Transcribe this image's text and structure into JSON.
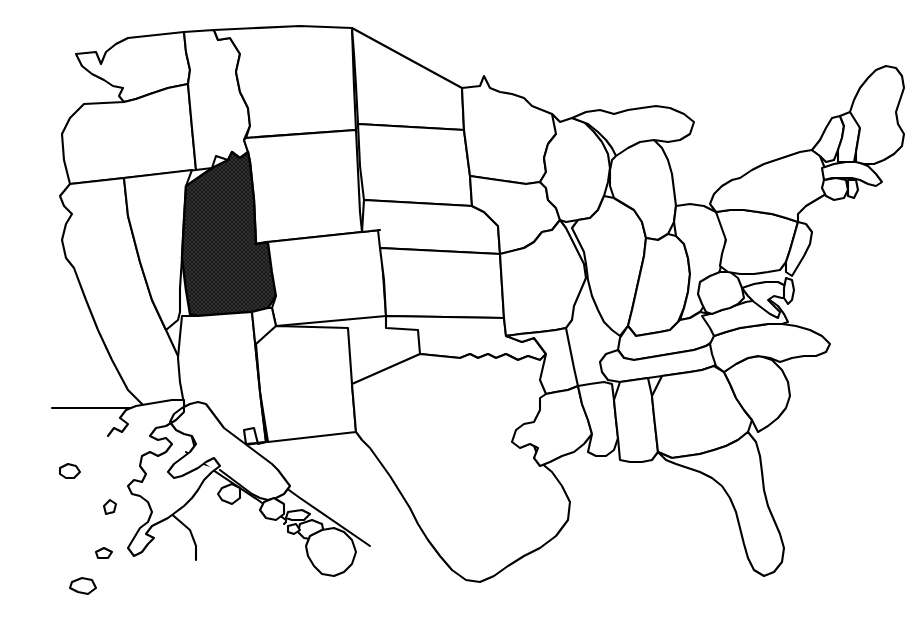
{
  "figure": {
    "title": "Map of the United States with Utah highlighted",
    "caption": "",
    "width": 921,
    "height": 638
  },
  "style": {
    "background_color": "#ffffff",
    "outline_color": "#000000",
    "state_fill_color": "#ffffff",
    "highlight_fill_color": "#1a1a1a",
    "highlight_pattern": "crosshatch"
  },
  "map": {
    "projection_note": "contiguous United States with Alaska and Hawaii insets at lower left",
    "highlighted_state": "Utah",
    "highlighted_state_abbr": "UT",
    "insets": [
      {
        "name": "Alaska",
        "abbr": "AK",
        "highlighted": false
      },
      {
        "name": "Hawaii",
        "abbr": "HI",
        "highlighted": false
      }
    ],
    "states": [
      {
        "abbr": "WA",
        "name": "Washington",
        "highlighted": false
      },
      {
        "abbr": "OR",
        "name": "Oregon",
        "highlighted": false
      },
      {
        "abbr": "CA",
        "name": "California",
        "highlighted": false
      },
      {
        "abbr": "NV",
        "name": "Nevada",
        "highlighted": false
      },
      {
        "abbr": "ID",
        "name": "Idaho",
        "highlighted": false
      },
      {
        "abbr": "MT",
        "name": "Montana",
        "highlighted": false
      },
      {
        "abbr": "WY",
        "name": "Wyoming",
        "highlighted": false
      },
      {
        "abbr": "UT",
        "name": "Utah",
        "highlighted": true
      },
      {
        "abbr": "AZ",
        "name": "Arizona",
        "highlighted": false
      },
      {
        "abbr": "CO",
        "name": "Colorado",
        "highlighted": false
      },
      {
        "abbr": "NM",
        "name": "New Mexico",
        "highlighted": false
      },
      {
        "abbr": "ND",
        "name": "North Dakota",
        "highlighted": false
      },
      {
        "abbr": "SD",
        "name": "South Dakota",
        "highlighted": false
      },
      {
        "abbr": "NE",
        "name": "Nebraska",
        "highlighted": false
      },
      {
        "abbr": "KS",
        "name": "Kansas",
        "highlighted": false
      },
      {
        "abbr": "OK",
        "name": "Oklahoma",
        "highlighted": false
      },
      {
        "abbr": "TX",
        "name": "Texas",
        "highlighted": false
      },
      {
        "abbr": "MN",
        "name": "Minnesota",
        "highlighted": false
      },
      {
        "abbr": "IA",
        "name": "Iowa",
        "highlighted": false
      },
      {
        "abbr": "MO",
        "name": "Missouri",
        "highlighted": false
      },
      {
        "abbr": "AR",
        "name": "Arkansas",
        "highlighted": false
      },
      {
        "abbr": "LA",
        "name": "Louisiana",
        "highlighted": false
      },
      {
        "abbr": "WI",
        "name": "Wisconsin",
        "highlighted": false
      },
      {
        "abbr": "IL",
        "name": "Illinois",
        "highlighted": false
      },
      {
        "abbr": "MI",
        "name": "Michigan",
        "highlighted": false
      },
      {
        "abbr": "IN",
        "name": "Indiana",
        "highlighted": false
      },
      {
        "abbr": "OH",
        "name": "Ohio",
        "highlighted": false
      },
      {
        "abbr": "KY",
        "name": "Kentucky",
        "highlighted": false
      },
      {
        "abbr": "TN",
        "name": "Tennessee",
        "highlighted": false
      },
      {
        "abbr": "MS",
        "name": "Mississippi",
        "highlighted": false
      },
      {
        "abbr": "AL",
        "name": "Alabama",
        "highlighted": false
      },
      {
        "abbr": "GA",
        "name": "Georgia",
        "highlighted": false
      },
      {
        "abbr": "FL",
        "name": "Florida",
        "highlighted": false
      },
      {
        "abbr": "SC",
        "name": "South Carolina",
        "highlighted": false
      },
      {
        "abbr": "NC",
        "name": "North Carolina",
        "highlighted": false
      },
      {
        "abbr": "VA",
        "name": "Virginia",
        "highlighted": false
      },
      {
        "abbr": "WV",
        "name": "West Virginia",
        "highlighted": false
      },
      {
        "abbr": "MD",
        "name": "Maryland",
        "highlighted": false
      },
      {
        "abbr": "DE",
        "name": "Delaware",
        "highlighted": false
      },
      {
        "abbr": "PA",
        "name": "Pennsylvania",
        "highlighted": false
      },
      {
        "abbr": "NJ",
        "name": "New Jersey",
        "highlighted": false
      },
      {
        "abbr": "NY",
        "name": "New York",
        "highlighted": false
      },
      {
        "abbr": "CT",
        "name": "Connecticut",
        "highlighted": false
      },
      {
        "abbr": "RI",
        "name": "Rhode Island",
        "highlighted": false
      },
      {
        "abbr": "MA",
        "name": "Massachusetts",
        "highlighted": false
      },
      {
        "abbr": "VT",
        "name": "Vermont",
        "highlighted": false
      },
      {
        "abbr": "NH",
        "name": "New Hampshire",
        "highlighted": false
      },
      {
        "abbr": "ME",
        "name": "Maine",
        "highlighted": false
      }
    ]
  }
}
